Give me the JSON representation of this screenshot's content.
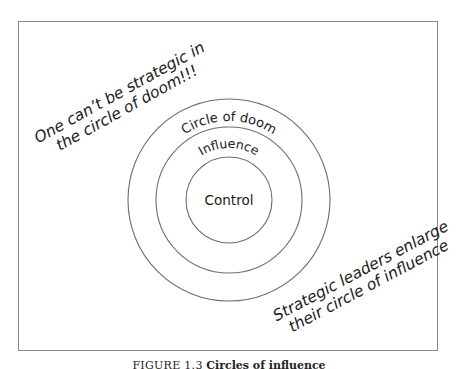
{
  "diagram": {
    "type": "concentric-circles",
    "center": {
      "x": 229,
      "y": 200
    },
    "rings": [
      {
        "id": "outer",
        "label": "Circle of doom",
        "radius": 101
      },
      {
        "id": "middle",
        "label": "Influence",
        "radius": 73
      },
      {
        "id": "inner",
        "label": "Control",
        "radius": 43
      }
    ],
    "annotations": {
      "left": {
        "line1": "One can’t be strategic in",
        "line2": "the circle of doom!!!"
      },
      "right": {
        "line1": "Strategic leaders enlarge",
        "line2": "their circle of influence"
      }
    }
  },
  "caption": {
    "label": "FIGURE 1.3",
    "title": "Circles of influence"
  },
  "colors": {
    "background": "#ffffff",
    "stroke": "#6e6e6e",
    "frame": "#8a8a8a",
    "text": "#1a1a1a"
  }
}
